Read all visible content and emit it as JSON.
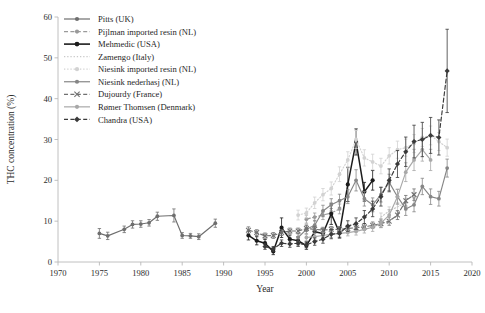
{
  "chart_data": {
    "type": "line",
    "title": "",
    "xlabel": "Year",
    "ylabel": "THC concentration (%)",
    "xlim": [
      1970,
      2020
    ],
    "ylim": [
      0,
      60
    ],
    "xticks": [
      1970,
      1975,
      1980,
      1985,
      1990,
      1995,
      2000,
      2005,
      2010,
      2015,
      2020
    ],
    "yticks": [
      0,
      10,
      20,
      30,
      40,
      50,
      60
    ],
    "grid": false,
    "legend_position": "top-left-inside",
    "error_bars": true,
    "series": [
      {
        "name": "Pitts (UK)",
        "color": "#6e6e6e",
        "dash": "solid",
        "marker": "circle",
        "x": [
          1975,
          1976,
          1978,
          1979,
          1980,
          1981,
          1982,
          1984,
          1985,
          1986,
          1987,
          1989
        ],
        "y": [
          7.0,
          6.4,
          8.0,
          9.2,
          9.3,
          9.6,
          11.2,
          11.4,
          6.5,
          6.4,
          6.2,
          9.5
        ],
        "yerr": [
          1.2,
          0.9,
          0.8,
          0.9,
          0.8,
          0.8,
          1.0,
          1.6,
          0.7,
          0.6,
          0.7,
          1.0
        ]
      },
      {
        "name": "Pijlman imported resin (NL)",
        "color": "#9a9a9a",
        "dash": "dashed",
        "marker": "circle",
        "x": [
          2000,
          2001,
          2002,
          2003,
          2004
        ],
        "y": [
          10.5,
          11.0,
          11.5,
          12.0,
          13.0
        ],
        "yerr": [
          1.0,
          1.0,
          1.1,
          1.1,
          1.2
        ]
      },
      {
        "name": "Mehmedic (USA)",
        "color": "#1c1c1c",
        "dash": "solid",
        "marker": "circle",
        "x": [
          1993,
          1994,
          1995,
          1996,
          1997,
          1998,
          1999,
          2000,
          2001,
          2002,
          2003,
          2004,
          2005,
          2006,
          2007,
          2008
        ],
        "y": [
          6.5,
          5.2,
          4.6,
          2.6,
          8.4,
          5.6,
          5.2,
          4.0,
          7.4,
          7.0,
          11.8,
          7.2,
          19.0,
          29.4,
          17.2,
          20.0
        ],
        "yerr": [
          1.1,
          1.0,
          0.9,
          0.8,
          2.4,
          1.0,
          1.0,
          0.9,
          1.2,
          1.1,
          2.6,
          1.3,
          4.2,
          3.2,
          2.3,
          2.4
        ]
      },
      {
        "name": "Zamengo (Italy)",
        "color": "#c9c9c9",
        "dash": "dotted",
        "marker": "none",
        "x": [
          2009,
          2010,
          2011,
          2012
        ],
        "y": [
          11.0,
          12.5,
          13.5,
          14.5
        ],
        "yerr": [
          1.0,
          1.0,
          1.1,
          1.1
        ]
      },
      {
        "name": "Niesink imported resin (NL)",
        "color": "#d2d2d2",
        "dash": "dotted",
        "marker": "circle",
        "x": [
          1999,
          2000,
          2001,
          2002,
          2003,
          2004,
          2005,
          2006,
          2007,
          2008,
          2009,
          2010,
          2011,
          2012,
          2013,
          2014,
          2015,
          2016,
          2017
        ],
        "y": [
          11.5,
          12.0,
          14.5,
          16.5,
          18.0,
          21.5,
          25.0,
          30.0,
          25.5,
          24.5,
          23.5,
          26.0,
          27.5,
          28.0,
          29.0,
          30.5,
          31.0,
          29.5,
          28.0
        ],
        "yerr": [
          1.2,
          1.2,
          1.4,
          1.5,
          1.6,
          1.8,
          2.0,
          2.2,
          2.0,
          1.9,
          1.9,
          2.0,
          2.1,
          2.1,
          2.2,
          2.2,
          2.3,
          2.2,
          2.1
        ]
      },
      {
        "name": "Niesink nederhasj (NL)",
        "color": "#868686",
        "dash": "solid",
        "marker": "circle",
        "x": [
          1999,
          2000,
          2001,
          2002,
          2003,
          2004,
          2005,
          2006,
          2007,
          2008,
          2009,
          2010,
          2011,
          2012,
          2013,
          2014,
          2015,
          2016,
          2017
        ],
        "y": [
          6.0,
          8.0,
          9.0,
          12.5,
          14.0,
          15.0,
          16.0,
          20.0,
          15.5,
          14.0,
          16.5,
          19.5,
          16.0,
          13.0,
          14.0,
          18.5,
          16.0,
          15.5,
          23.0
        ],
        "yerr": [
          1.0,
          1.1,
          1.2,
          1.4,
          1.5,
          1.6,
          1.7,
          2.6,
          1.8,
          1.7,
          1.8,
          2.0,
          1.8,
          1.6,
          1.7,
          2.0,
          1.9,
          1.8,
          2.2
        ]
      },
      {
        "name": "Dujourdy (France)",
        "color": "#707070",
        "dash": "dashed",
        "marker": "cross",
        "x": [
          1993,
          1994,
          1995,
          1996,
          1997,
          1998,
          1999,
          2000,
          2001,
          2002,
          2003,
          2004,
          2005,
          2006,
          2007,
          2008,
          2009,
          2010,
          2011,
          2012,
          2013
        ],
        "y": [
          7.8,
          7.2,
          6.4,
          6.5,
          7.2,
          7.6,
          7.6,
          8.2,
          8.0,
          7.8,
          8.0,
          8.0,
          8.2,
          8.4,
          8.6,
          9.0,
          9.4,
          10.0,
          11.5,
          15.0,
          16.5
        ],
        "yerr": [
          0.8,
          0.7,
          0.7,
          0.7,
          0.7,
          0.7,
          0.7,
          0.7,
          0.7,
          0.7,
          0.7,
          0.7,
          0.7,
          0.8,
          0.8,
          0.8,
          0.9,
          1.0,
          1.1,
          1.3,
          1.4
        ]
      },
      {
        "name": "Rømer Thomsen (Denmark)",
        "color": "#a8a8a8",
        "dash": "solid",
        "marker": "circle",
        "x": [
          2000,
          2001,
          2002,
          2003,
          2004,
          2005,
          2006,
          2007,
          2008,
          2009,
          2010,
          2011,
          2012,
          2013,
          2014,
          2015
        ],
        "y": [
          6.0,
          6.2,
          6.5,
          6.8,
          7.0,
          7.2,
          7.5,
          8.0,
          8.5,
          9.5,
          11.5,
          16.0,
          22.0,
          25.0,
          27.5,
          25.0
        ],
        "yerr": [
          0.8,
          0.8,
          0.8,
          0.8,
          0.8,
          0.8,
          0.9,
          0.9,
          1.0,
          1.1,
          1.3,
          1.8,
          2.3,
          2.6,
          2.8,
          2.6
        ]
      },
      {
        "name": "Chandra (USA)",
        "color": "#3a3a3a",
        "dash": "dashed",
        "marker": "diamond",
        "x": [
          1995,
          1996,
          1997,
          1998,
          1999,
          2000,
          2001,
          2002,
          2003,
          2004,
          2005,
          2006,
          2007,
          2008,
          2009,
          2010,
          2011,
          2012,
          2013,
          2014,
          2015,
          2016,
          2017
        ],
        "y": [
          3.8,
          3.2,
          4.6,
          4.4,
          4.6,
          4.2,
          5.0,
          5.6,
          6.8,
          7.0,
          8.8,
          9.4,
          11.0,
          13.0,
          16.0,
          20.0,
          24.0,
          27.0,
          29.5,
          30.0,
          31.0,
          30.5,
          46.8
        ],
        "yerr": [
          0.7,
          0.6,
          0.8,
          0.8,
          0.8,
          0.7,
          0.9,
          1.0,
          1.1,
          1.1,
          1.3,
          1.4,
          1.6,
          1.9,
          2.3,
          2.8,
          3.3,
          3.6,
          4.0,
          4.2,
          4.4,
          4.3,
          10.2
        ]
      }
    ]
  },
  "legend": {
    "items": [
      "Pitts (UK)",
      "Pijlman imported resin (NL)",
      "Mehmedic (USA)",
      "Zamengo (Italy)",
      "Niesink imported resin (NL)",
      "Niesink nederhasj (NL)",
      "Dujourdy (France)",
      "Rømer Thomsen (Denmark)",
      "Chandra (USA)"
    ]
  },
  "caption": ""
}
